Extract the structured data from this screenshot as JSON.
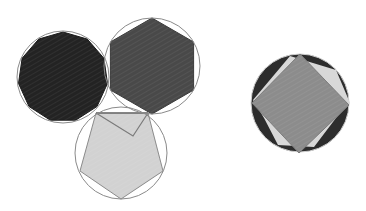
{
  "figure": {
    "width": 366,
    "height": 211,
    "background": "#ffffff",
    "left_group": {
      "circles": [
        {
          "name": "circle-polygon-11",
          "cx": 63,
          "cy": 77,
          "r": 46,
          "stroke": "#8a8a8a",
          "fill": "none"
        },
        {
          "name": "circle-hexagon",
          "cx": 152,
          "cy": 66,
          "r": 48,
          "stroke": "#8a8a8a",
          "fill": "none"
        },
        {
          "name": "circle-pentagon",
          "cx": 121,
          "cy": 153,
          "r": 46,
          "stroke": "#8a8a8a",
          "fill": "none"
        }
      ],
      "polygons": [
        {
          "name": "polygon-11-gon",
          "cx": 63,
          "cy": 77,
          "r": 45,
          "sides": 11,
          "rotation_deg": -90,
          "fill": "#232323",
          "stroke": "#1a1a1a"
        },
        {
          "name": "hexagon",
          "cx": 152,
          "cy": 66,
          "r": 48,
          "sides": 6,
          "rotation_deg": -90,
          "fill": "#494949",
          "stroke": "#3a3a3a"
        },
        {
          "name": "pentagon",
          "points": [
            [
              96,
              113
            ],
            [
              148,
              113
            ],
            [
              163,
              171
            ],
            [
              121,
              199
            ],
            [
              80,
              171
            ]
          ],
          "fill": "#d2d2d2",
          "stroke": "#8a8a8a"
        }
      ],
      "lines": [
        {
          "name": "pentagon-top-edge",
          "points": [
            [
              96,
              113
            ],
            [
              148,
              113
            ]
          ],
          "stroke": "#6f6f6f",
          "width": 1.6
        },
        {
          "name": "pentagon-inner-v",
          "points": [
            [
              96,
              113
            ],
            [
              133,
              136
            ],
            [
              148,
              113
            ]
          ],
          "stroke": "#7a7a7a",
          "width": 1.2
        }
      ]
    },
    "right_group": {
      "outer_circle": {
        "name": "dark-circle",
        "cx": 300,
        "cy": 103,
        "r": 49,
        "fill": "#2d2d2d",
        "stroke": "#d0d0d0"
      },
      "light_polygon": {
        "name": "light-octagon",
        "points": [
          [
            290,
            56
          ],
          [
            336,
            70
          ],
          [
            350,
            103
          ],
          [
            336,
            118
          ],
          [
            314,
            147
          ],
          [
            278,
            145
          ],
          [
            264,
            118
          ],
          [
            253,
            100
          ]
        ],
        "fill": "#d8d8d8"
      },
      "square": {
        "name": "gray-square",
        "points": [
          [
            300,
            54
          ],
          [
            349,
            105
          ],
          [
            299,
            153
          ],
          [
            252,
            103
          ]
        ],
        "fill": "#8c8c8c",
        "stroke": "#7a7a7a"
      }
    }
  }
}
